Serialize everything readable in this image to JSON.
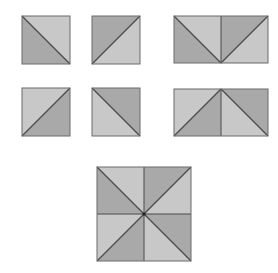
{
  "colors": {
    "light": "#c8c8c8",
    "dark": "#a9a9a9",
    "stroke": "#4a4a4a",
    "background": "#ffffff"
  },
  "tile_types": {
    "A": {
      "diagonal": "tl-br",
      "dark": "bottom-left",
      "light": "top-right"
    },
    "B": {
      "diagonal": "bl-tr",
      "dark": "top-left",
      "light": "bottom-right"
    },
    "C": {
      "diagonal": "bl-tr",
      "dark": "bottom-right",
      "light": "top-left"
    },
    "D": {
      "diagonal": "tl-br",
      "dark": "top-right",
      "light": "bottom-left"
    }
  },
  "shapes": [
    {
      "name": "square-a",
      "x": 22,
      "y": 16,
      "size": 48,
      "tiles": [
        [
          "A"
        ]
      ]
    },
    {
      "name": "square-b",
      "x": 92,
      "y": 16,
      "size": 48,
      "tiles": [
        [
          "B"
        ]
      ]
    },
    {
      "name": "rectangle-ab",
      "x": 174,
      "y": 16,
      "size": 47,
      "tiles": [
        [
          "A",
          "B"
        ]
      ]
    },
    {
      "name": "square-c",
      "x": 22,
      "y": 88,
      "size": 48,
      "tiles": [
        [
          "C"
        ]
      ]
    },
    {
      "name": "square-d",
      "x": 92,
      "y": 88,
      "size": 48,
      "tiles": [
        [
          "D"
        ]
      ]
    },
    {
      "name": "rectangle-cd",
      "x": 174,
      "y": 89,
      "size": 47,
      "tiles": [
        [
          "C",
          "D"
        ]
      ]
    },
    {
      "name": "big-square-abcd",
      "x": 97,
      "y": 167,
      "size": 47,
      "tiles": [
        [
          "A",
          "B"
        ],
        [
          "C",
          "D"
        ]
      ],
      "center_dot": true
    }
  ]
}
